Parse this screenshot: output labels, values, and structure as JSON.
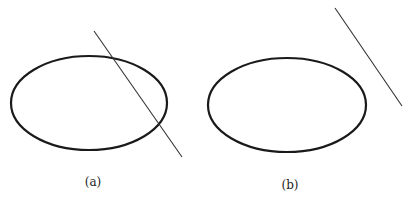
{
  "panels": [
    {
      "label": "(a)",
      "description": "ellipse intersected by a line",
      "ellipse": {
        "cx": 89,
        "cy": 103,
        "rx": 78,
        "ry": 47
      },
      "line": {
        "x1": 94,
        "y1": 31,
        "x2": 182,
        "y2": 157
      },
      "label_pos": {
        "x": 93,
        "y": 186
      }
    },
    {
      "label": "(b)",
      "description": "ellipse with a non-intersecting line",
      "ellipse": {
        "cx": 287,
        "cy": 105,
        "rx": 79,
        "ry": 47
      },
      "line": {
        "x1": 335,
        "y1": 8,
        "x2": 402,
        "y2": 106
      },
      "label_pos": {
        "x": 290,
        "y": 189
      }
    }
  ],
  "colors": {
    "stroke": "#1a1a1a",
    "background": "#ffffff"
  }
}
